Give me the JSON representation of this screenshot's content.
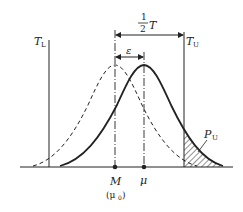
{
  "diagram": {
    "type": "normal-distribution-shift",
    "labels": {
      "lower_limit": "T",
      "lower_limit_sub": "L",
      "upper_limit": "T",
      "upper_limit_sub": "U",
      "half_tolerance_num": "1",
      "half_tolerance_den": "2",
      "half_tolerance_var": "T",
      "shift": "ε",
      "center": "M",
      "center_alt": "(μ",
      "center_alt_sub": "0",
      "center_alt_close": ")",
      "mean": "μ",
      "defect_prob": "P",
      "defect_prob_sub": "U"
    },
    "curves": [
      {
        "name": "target-distribution",
        "style": "dashed",
        "center_label": "M (μ0)"
      },
      {
        "name": "shifted-distribution",
        "style": "solid",
        "center_label": "μ"
      }
    ],
    "colors": {
      "line": "#222222",
      "background": "#ffffff"
    }
  }
}
